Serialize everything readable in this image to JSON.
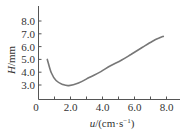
{
  "chart_data": {
    "type": "line",
    "title": "",
    "xlabel": "u/(cm·s⁻¹)",
    "ylabel": "H/mm",
    "xlim": [
      0,
      8.6
    ],
    "ylim": [
      1.1,
      8.6
    ],
    "x_ticks": [
      0,
      1.0,
      2.0,
      3.0,
      4.0,
      5.0,
      6.0,
      7.0,
      8.0
    ],
    "x_tick_labels": [
      "0",
      "2.0",
      "4.0",
      "6.0",
      "8.0"
    ],
    "x_tick_label_positions": [
      0,
      2.0,
      4.0,
      6.0,
      8.0
    ],
    "y_ticks": [
      3.0,
      4.0,
      5.0,
      6.0,
      7.0,
      8.0
    ],
    "y_tick_labels": [
      "3.0",
      "4.0",
      "5.0",
      "6.0",
      "7.0",
      "8.0"
    ],
    "grid": false,
    "legend": null,
    "series": [
      {
        "name": "H",
        "color": "#777777",
        "x": [
          0.55,
          0.8,
          1.1,
          1.5,
          1.9,
          2.5,
          3.2,
          3.9,
          4.5,
          5.2,
          5.8,
          6.5,
          7.1,
          7.5,
          7.8
        ],
        "y": [
          5.0,
          3.95,
          3.35,
          3.05,
          2.95,
          3.15,
          3.6,
          4.05,
          4.5,
          4.95,
          5.4,
          5.95,
          6.4,
          6.65,
          6.8
        ]
      }
    ]
  },
  "axis": {
    "x_title_main": "u",
    "x_title_unit": "/(cm·s",
    "x_title_exp": "−1",
    "x_title_close": ")",
    "y_title_main": "H",
    "y_title_unit": "/mm"
  }
}
